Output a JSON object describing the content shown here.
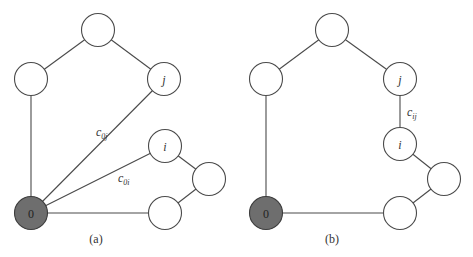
{
  "panels": [
    {
      "caption": "(a)",
      "nodes": [
        {
          "id": "top",
          "label": ""
        },
        {
          "id": "left",
          "label": ""
        },
        {
          "id": "j",
          "label": "j"
        },
        {
          "id": "i",
          "label": "i"
        },
        {
          "id": "right",
          "label": ""
        },
        {
          "id": "bottom-right",
          "label": ""
        },
        {
          "id": "depot",
          "label": "0"
        }
      ],
      "edge_labels": {
        "c0j": {
          "base": "c",
          "sub": "0j"
        },
        "c0i": {
          "base": "c",
          "sub": "0i"
        }
      }
    },
    {
      "caption": "(b)",
      "nodes": [
        {
          "id": "top",
          "label": ""
        },
        {
          "id": "left",
          "label": ""
        },
        {
          "id": "j",
          "label": "j"
        },
        {
          "id": "i",
          "label": "i"
        },
        {
          "id": "right",
          "label": ""
        },
        {
          "id": "bottom-right",
          "label": ""
        },
        {
          "id": "depot",
          "label": "0"
        }
      ],
      "edge_labels": {
        "cij": {
          "base": "c",
          "sub": "ij"
        }
      }
    }
  ],
  "colors": {
    "depot_fill": "#6e6e6e",
    "node_fill": "#ffffff",
    "stroke": "#4a4a4a"
  }
}
